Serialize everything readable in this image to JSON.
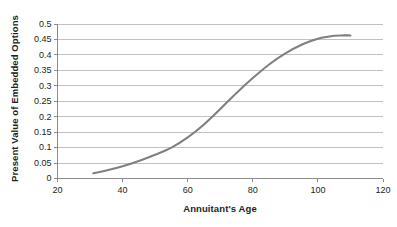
{
  "chart_data": {
    "type": "line",
    "title": "",
    "xlabel": "Annuitant's Age",
    "ylabel": "Present Value of Embedded Options",
    "xlim": [
      20,
      120
    ],
    "ylim": [
      0,
      0.5
    ],
    "grid": "horizontal",
    "legend": "none",
    "x_ticks": [
      "20",
      "40",
      "60",
      "80",
      "100",
      "120"
    ],
    "y_ticks": [
      "0",
      "0.05",
      "0.1",
      "0.15",
      "0.2",
      "0.25",
      "0.3",
      "0.35",
      "0.4",
      "0.45",
      "0.5"
    ],
    "series": [
      {
        "name": "Present Value of Embedded Options",
        "color": "#808080",
        "x": [
          31,
          35,
          40,
          45,
          50,
          55,
          60,
          65,
          70,
          75,
          80,
          85,
          90,
          95,
          100,
          103,
          105,
          107,
          110
        ],
        "values": [
          0.017,
          0.026,
          0.04,
          0.057,
          0.077,
          0.1,
          0.133,
          0.175,
          0.225,
          0.277,
          0.325,
          0.369,
          0.405,
          0.433,
          0.452,
          0.459,
          0.462,
          0.463,
          0.463
        ]
      }
    ]
  }
}
